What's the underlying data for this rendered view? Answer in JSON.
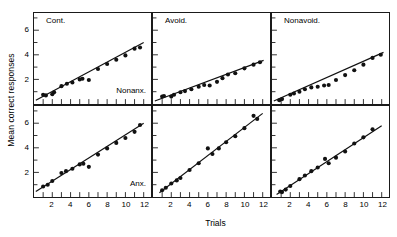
{
  "chart_data": {
    "type": "scatter",
    "title": "",
    "xlabel": "Trials",
    "ylabel": "Mean correct responses",
    "xlim": [
      0,
      12.8
    ],
    "ylim": [
      0,
      7.4
    ],
    "xticks": [
      2,
      4,
      6,
      8,
      10,
      12
    ],
    "yticks": [
      2,
      4,
      6
    ],
    "grid": false,
    "legend": "none",
    "layout": {
      "rows": 2,
      "cols": 3
    },
    "column_labels": [
      "Cont.",
      "Avoid.",
      "Nonavoid."
    ],
    "row_labels": [
      "Nonanx.",
      "Anx."
    ],
    "panels": [
      {
        "id": "cont-nonanx",
        "column_label": "Cont.",
        "row_label": "Nonanx.",
        "x": [
          1,
          1.3,
          2,
          2.2,
          3,
          3.6,
          4.2,
          5,
          5.3,
          6,
          7,
          8,
          9,
          10,
          11,
          11.6
        ],
        "y": [
          0.75,
          0.7,
          0.8,
          0.95,
          1.45,
          1.65,
          1.75,
          2.0,
          2.05,
          1.95,
          2.85,
          3.25,
          3.6,
          3.95,
          4.5,
          4.6
        ],
        "fit_x": [
          0.2,
          12.0
        ],
        "fit_y": [
          0.3,
          5.0
        ]
      },
      {
        "id": "avoid-nonanx",
        "column_label": "Avoid.",
        "row_label": "",
        "x": [
          1,
          1.2,
          2,
          2.3,
          3,
          3.5,
          4.2,
          5,
          5.6,
          6.2,
          7,
          7.6,
          8.2,
          9,
          10,
          11,
          11.7
        ],
        "y": [
          0.6,
          0.65,
          0.6,
          0.75,
          0.95,
          1.05,
          1.2,
          1.4,
          1.55,
          1.5,
          1.8,
          2.1,
          2.4,
          2.5,
          2.9,
          3.2,
          3.4
        ],
        "fit_x": [
          0.2,
          12.1
        ],
        "fit_y": [
          0.25,
          3.55
        ]
      },
      {
        "id": "nonavoid-nonanx",
        "column_label": "Nonavoid.",
        "row_label": "",
        "x": [
          0.8,
          1.1,
          2,
          2.4,
          3,
          3.6,
          4.3,
          5,
          5.7,
          6.2,
          7,
          8,
          9,
          10,
          11,
          11.9
        ],
        "y": [
          0.3,
          0.4,
          0.75,
          0.85,
          1.0,
          1.2,
          1.35,
          1.4,
          1.5,
          1.55,
          1.95,
          2.35,
          2.75,
          3.2,
          3.75,
          4.0
        ],
        "fit_x": [
          0.2,
          12.2
        ],
        "fit_y": [
          0.25,
          4.2
        ]
      },
      {
        "id": "cont-anx",
        "column_label": "",
        "row_label": "Anx.",
        "x": [
          1,
          1.5,
          2,
          3,
          3.5,
          4.2,
          5,
          5.4,
          6,
          7,
          8,
          9,
          10,
          11,
          11.6
        ],
        "y": [
          0.85,
          1.0,
          1.3,
          1.95,
          2.1,
          2.3,
          2.65,
          2.7,
          2.45,
          3.45,
          3.95,
          4.4,
          4.8,
          5.3,
          5.85
        ],
        "fit_x": [
          0.2,
          12.0
        ],
        "fit_y": [
          0.45,
          6.0
        ]
      },
      {
        "id": "avoid-anx",
        "column_label": "",
        "row_label": "",
        "x": [
          1,
          1.4,
          2,
          2.6,
          3,
          4,
          5,
          6,
          6.5,
          7.2,
          8,
          9,
          10,
          11,
          11.4
        ],
        "y": [
          0.55,
          0.75,
          1.1,
          1.35,
          1.55,
          2.2,
          2.75,
          3.95,
          3.5,
          3.95,
          4.45,
          4.95,
          5.6,
          6.6,
          6.35
        ],
        "fit_x": [
          0.7,
          12.0
        ],
        "fit_y": [
          0.35,
          6.8
        ]
      },
      {
        "id": "nonavoid-anx",
        "column_label": "",
        "row_label": "",
        "x": [
          0.9,
          1.1,
          1.5,
          2,
          3,
          3.6,
          4.3,
          5,
          5.8,
          6.2,
          7,
          8,
          9,
          10,
          11
        ],
        "y": [
          0.45,
          0.4,
          0.6,
          0.9,
          1.45,
          1.75,
          2.1,
          2.4,
          3.1,
          2.75,
          3.2,
          3.7,
          4.35,
          4.85,
          5.5
        ],
        "fit_x": [
          0.5,
          12.0
        ],
        "fit_y": [
          0.2,
          5.8
        ]
      }
    ],
    "style": {
      "marker_color": "#111111",
      "line_color": "#111111",
      "axis_color": "#1a1a1a",
      "background": "#ffffff"
    }
  }
}
